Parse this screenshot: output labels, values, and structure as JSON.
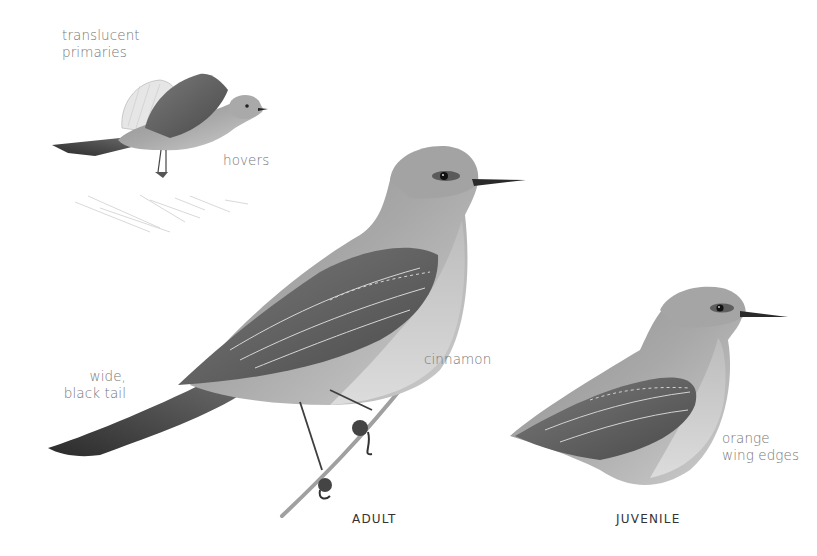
{
  "plate": {
    "background": "#ffffff",
    "figures": [
      {
        "id": "hovering",
        "labels": [
          {
            "text_lines": [
              "translucent",
              "primaries"
            ]
          },
          {
            "text_lines": [
              "hovers"
            ]
          }
        ]
      },
      {
        "id": "adult",
        "caption": "ADULT",
        "labels": [
          {
            "text_lines": [
              "wide,",
              "black tail"
            ]
          },
          {
            "text_lines": [
              "cinnamon"
            ]
          }
        ]
      },
      {
        "id": "juvenile",
        "caption": "JUVENILE",
        "labels": [
          {
            "text_lines": [
              "orange",
              "wing edges"
            ]
          }
        ]
      }
    ],
    "colors": {
      "label_text": "#777777",
      "caption_text": "#333333",
      "plumage_light": "#c9c9c9",
      "plumage_mid": "#9a9a9a",
      "plumage_dark": "#3a3a3a"
    }
  }
}
